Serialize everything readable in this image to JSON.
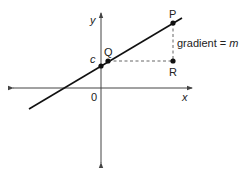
{
  "diagram": {
    "type": "line-graph",
    "axes": {
      "x_label": "x",
      "y_label": "y",
      "origin_label": "0"
    },
    "points": {
      "intercept": {
        "label": "c"
      },
      "Q": {
        "label": "Q"
      },
      "P": {
        "label": "P"
      },
      "R": {
        "label": "R"
      }
    },
    "annotation": {
      "prefix": "gradient = ",
      "symbol": "m"
    },
    "colors": {
      "line": "#111111",
      "axis": "#444444",
      "dashed": "#555555",
      "text": "#222222"
    }
  }
}
